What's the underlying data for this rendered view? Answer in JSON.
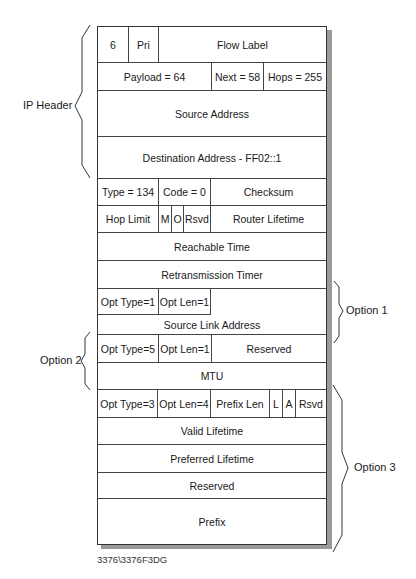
{
  "diagram": {
    "rows": [
      {
        "cells": [
          {
            "text": "6",
            "w": 30
          },
          {
            "text": "Pri",
            "w": 30
          },
          {
            "text": "Flow Label",
            "w": 170
          }
        ]
      },
      {
        "cells": [
          {
            "text": "Payload = 64",
            "w": 113
          },
          {
            "text": "Next = 58",
            "w": 52
          },
          {
            "text": "Hops = 255",
            "w": 65
          }
        ]
      },
      {
        "cells": [
          {
            "text": "Source Address",
            "w": 230
          }
        ]
      },
      {
        "cells": [
          {
            "text": "Destination Address - FF02::1",
            "w": 230
          }
        ]
      },
      {
        "cells": [
          {
            "text": "Type = 134",
            "w": 60
          },
          {
            "text": "Code = 0",
            "w": 52
          },
          {
            "text": "Checksum",
            "w": 118
          }
        ]
      },
      {
        "cells": [
          {
            "text": "Hop Limit",
            "w": 60
          },
          {
            "text": "M",
            "w": 13
          },
          {
            "text": "O",
            "w": 12
          },
          {
            "text": "Rsvd",
            "w": 27
          },
          {
            "text": "Router Lifetime",
            "w": 118
          }
        ]
      },
      {
        "cells": [
          {
            "text": "Reachable Time",
            "w": 230
          }
        ]
      },
      {
        "cells": [
          {
            "text": "Retransmission Timer",
            "w": 230
          }
        ]
      },
      {
        "cells": [
          {
            "text": "Opt Type=1",
            "w": 60
          },
          {
            "text": "Opt Len=1",
            "w": 52
          }
        ],
        "bottom_text": "Source Link Address"
      },
      {
        "cells": [
          {
            "text": "Opt Type=5",
            "w": 60
          },
          {
            "text": "Opt Len=1",
            "w": 53
          },
          {
            "text": "Reserved",
            "w": 117
          }
        ]
      },
      {
        "cells": [
          {
            "text": "MTU",
            "w": 230
          }
        ]
      },
      {
        "cells": [
          {
            "text": "Opt Type=3",
            "w": 59
          },
          {
            "text": "Opt Len=4",
            "w": 53
          },
          {
            "text": "Prefix Len",
            "w": 59
          },
          {
            "text": "L",
            "w": 13
          },
          {
            "text": "A",
            "w": 13
          },
          {
            "text": "Rsvd",
            "w": 33
          }
        ]
      },
      {
        "cells": [
          {
            "text": "Valid Lifetime",
            "w": 230
          }
        ]
      },
      {
        "cells": [
          {
            "text": "Preferred Lifetime",
            "w": 230
          }
        ]
      },
      {
        "cells": [
          {
            "text": "Reserved",
            "w": 230
          }
        ]
      },
      {
        "cells": [
          {
            "text": "Prefix",
            "w": 230
          }
        ]
      }
    ],
    "groups": {
      "ip_header": "IP Header",
      "option1": "Option 1",
      "option2": "Option 2",
      "option3": "Option 3"
    },
    "figure_id": "3376\\3376F3DG"
  }
}
